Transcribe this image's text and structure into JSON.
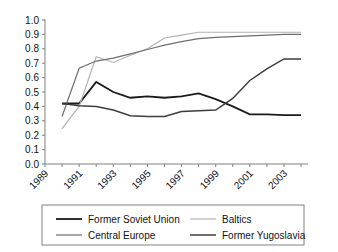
{
  "chart_data": {
    "type": "line",
    "title": "",
    "subtitle": "",
    "xlabel": "",
    "ylabel": "",
    "xlim": [
      1989,
      2004
    ],
    "ylim": [
      0.0,
      1.0
    ],
    "grid": false,
    "legend_position": "bottom",
    "x": [
      1990,
      1991,
      1992,
      1993,
      1994,
      1995,
      1996,
      1997,
      1998,
      1999,
      2000,
      2001,
      2002,
      2003,
      2004
    ],
    "x_tick_labels": [
      "1989",
      "1991",
      "1993",
      "1995",
      "1997",
      "1999",
      "2001",
      "2003"
    ],
    "x_tick_values": [
      1989,
      1991,
      1993,
      1995,
      1997,
      1999,
      2001,
      2003
    ],
    "y_tick_labels": [
      "0.0",
      "0.1",
      "0.2",
      "0.3",
      "0.4",
      "0.5",
      "0.6",
      "0.7",
      "0.8",
      "0.9",
      "1.0"
    ],
    "y_tick_values": [
      0.0,
      0.1,
      0.2,
      0.3,
      0.4,
      0.5,
      0.6,
      0.7,
      0.8,
      0.9,
      1.0
    ],
    "series": [
      {
        "name": "Former Soviet Union",
        "color": "#1a1a1a",
        "width": 1.8,
        "values": [
          0.42,
          0.42,
          0.57,
          0.5,
          0.46,
          0.47,
          0.46,
          0.47,
          0.49,
          0.45,
          0.4,
          0.345,
          0.345,
          0.34,
          0.34
        ]
      },
      {
        "name": "Baltics",
        "color": "#b3b3b3",
        "width": 1.2,
        "values": [
          0.245,
          0.4,
          0.745,
          0.705,
          0.755,
          0.8,
          0.875,
          0.895,
          0.915,
          0.915,
          0.915,
          0.915,
          0.915,
          0.915,
          0.915
        ]
      },
      {
        "name": "Central Europe",
        "color": "#6e6e6e",
        "width": 1.2,
        "values": [
          0.33,
          0.665,
          0.715,
          0.735,
          0.765,
          0.795,
          0.825,
          0.85,
          0.87,
          0.88,
          0.885,
          0.89,
          0.895,
          0.9,
          0.9
        ]
      },
      {
        "name": "Former Yugoslavia",
        "color": "#3d3d3d",
        "width": 1.5,
        "values": [
          0.42,
          0.405,
          0.4,
          0.375,
          0.335,
          0.33,
          0.33,
          0.365,
          0.37,
          0.375,
          0.455,
          0.58,
          0.66,
          0.73,
          0.73
        ]
      }
    ]
  },
  "legend": {
    "entries": [
      {
        "label": "Former Soviet Union"
      },
      {
        "label": "Baltics"
      },
      {
        "label": "Central Europe"
      },
      {
        "label": "Former Yugoslavia"
      }
    ]
  }
}
